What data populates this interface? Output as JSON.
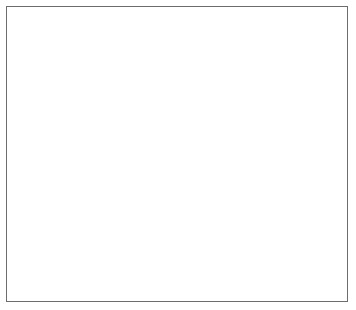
{
  "chart_data": {
    "type": "line",
    "title": "",
    "xlabel": "Year",
    "ylabel": "Number of passes",
    "x": [
      1995,
      2000,
      2005,
      2010
    ],
    "categories": [
      "1995",
      "2000",
      "2005",
      "2010"
    ],
    "xlim": [
      1993,
      2012
    ],
    "ylim": [
      40,
      85
    ],
    "ytick_step": 5,
    "yticks": [
      40,
      45,
      50,
      55,
      60,
      65,
      70,
      75,
      80,
      85
    ],
    "ytick_labels": [
      "40",
      "45",
      "50",
      "55",
      "60",
      "65",
      "70",
      "75",
      "80",
      "85"
    ],
    "xticks": [
      1995,
      2000,
      2005,
      2010
    ],
    "xtick_labels": [
      "1995",
      "2000",
      "2005",
      "2010"
    ],
    "grid": "horizontal",
    "legend_position": "bottom-inside",
    "series": [
      {
        "name": "National average",
        "values": [
          74,
          64,
          69,
          71
        ],
        "marker": "diamond",
        "line_style": "dashed",
        "color": "#111111"
      },
      {
        "name": "BritDrive",
        "values": [
          82,
          47,
          65,
          78
        ],
        "marker": "square",
        "line_style": "solid",
        "color": "#7a7a7a"
      },
      {
        "name": "LearnFaster",
        "values": [
          70,
          58,
          61,
          65
        ],
        "marker": "triangle",
        "line_style": "solid",
        "color": "#7a7a7a"
      }
    ]
  },
  "axes": {
    "y_title": "Number of passes",
    "x_title": "Year"
  },
  "legend": {
    "items": [
      {
        "label": "National average"
      },
      {
        "label": "BritDrive"
      },
      {
        "label": "LearnFaster"
      }
    ]
  },
  "colors": {
    "grid": "#8a8a8a",
    "plot_border": "#4a4a4a",
    "frame": "#6d6d6d",
    "series_dark": "#111111",
    "series_gray": "#7a7a7a",
    "background": "#ffffff"
  }
}
